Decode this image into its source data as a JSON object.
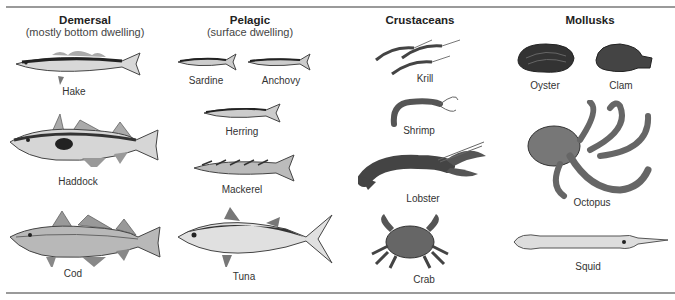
{
  "categories": [
    {
      "title": "Demersal",
      "subtitle": "(mostly bottom dwelling)",
      "species": [
        "Hake",
        "Haddock",
        "Cod"
      ]
    },
    {
      "title": "Pelagic",
      "subtitle": "(surface dwelling)",
      "species": [
        "Sardine",
        "Anchovy",
        "Herring",
        "Mackerel",
        "Tuna"
      ]
    },
    {
      "title": "Crustaceans",
      "subtitle": "",
      "species": [
        "Krill",
        "Shrimp",
        "Lobster",
        "Crab"
      ]
    },
    {
      "title": "Mollusks",
      "subtitle": "",
      "species": [
        "Oyster",
        "Clam",
        "Octopus",
        "Squid"
      ]
    }
  ],
  "colors": {
    "rule": "#9a9a9a",
    "fish_dark": "#3a3a3a",
    "fish_mid": "#8a8a8a",
    "fish_light": "#e2e2e2"
  }
}
